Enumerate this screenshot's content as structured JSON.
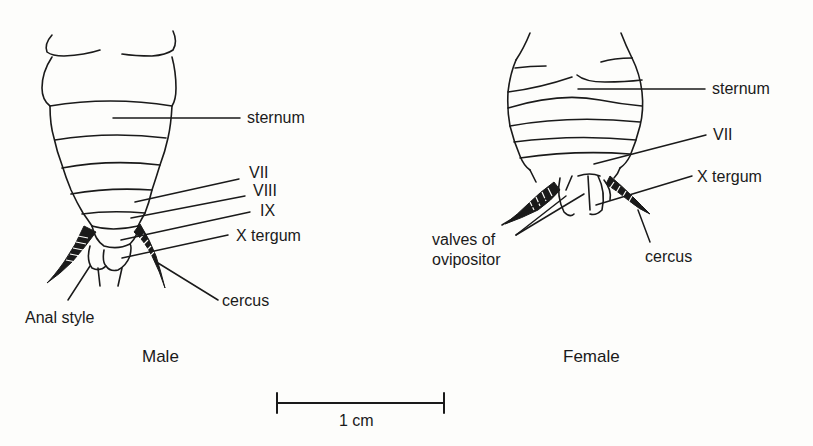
{
  "figure": {
    "type": "anatomical-diagram"
  },
  "male": {
    "caption": "Male",
    "labels": {
      "sternum": "sternum",
      "seg7": "VII",
      "seg8": "VIII",
      "seg9": "IX",
      "tergum10": "X tergum",
      "cercus": "cercus",
      "anal_style": "Anal style"
    }
  },
  "female": {
    "caption": "Female",
    "labels": {
      "sternum": "sternum",
      "seg7": "VII",
      "tergum10": "X tergum",
      "valves_line1": "valves of",
      "valves_line2": "ovipositor",
      "cercus": "cercus"
    }
  },
  "scale_bar": {
    "label": "1 cm"
  }
}
